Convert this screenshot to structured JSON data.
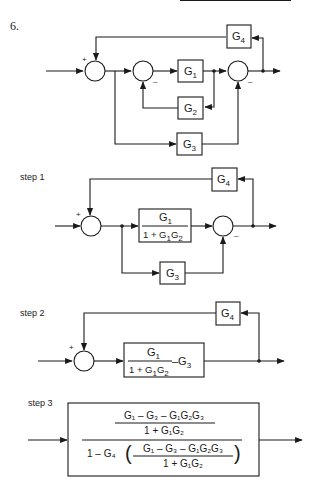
{
  "problem": {
    "number": "6."
  },
  "original": {
    "blocks": {
      "g1": {
        "base": "G",
        "sub": "1"
      },
      "g2": {
        "base": "G",
        "sub": "2"
      },
      "g3": {
        "base": "G",
        "sub": "3"
      },
      "g4": {
        "base": "G",
        "sub": "4"
      }
    },
    "signs": {
      "plus": "+",
      "minus1": "–",
      "minus2": "–"
    }
  },
  "step1": {
    "label": "step 1",
    "block_main": {
      "num_base": "G",
      "num_sub": "1",
      "den": "1 + G",
      "den_sub1": "1",
      "den_mid": "G",
      "den_sub2": "2"
    },
    "g3": {
      "base": "G",
      "sub": "3"
    },
    "g4": {
      "base": "G",
      "sub": "4"
    },
    "signs": {
      "plus": "+",
      "minus": "–"
    }
  },
  "step2": {
    "label": "step 2",
    "block_main": {
      "num_base": "G",
      "num_sub": "1",
      "den": "1 + G",
      "den_sub1": "1",
      "den_mid": "G",
      "den_sub2": "2",
      "tail": "–G",
      "tail_sub": "3"
    },
    "g4": {
      "base": "G",
      "sub": "4"
    },
    "signs": {
      "plus": "+"
    }
  },
  "step3": {
    "label": "step 3",
    "numerator_top": "G₁ – G₃ – G₁G₂G₃",
    "numerator_bottom": "1 + G₁G₂",
    "denominator_prefix": "1 – G₄",
    "denominator_inner_top": "G₁ – G₃ – G₁G₂G₃",
    "denominator_inner_bottom": "1 + G₁G₂"
  }
}
